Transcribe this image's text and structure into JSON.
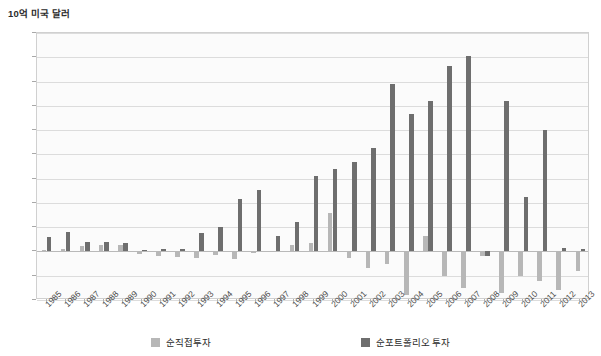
{
  "chart_data": {
    "type": "bar",
    "title": "10억 미국 달러",
    "xlabel": "",
    "ylabel": "10억 미국 달러",
    "ylim": [
      -200,
      900
    ],
    "ytick_step": 100,
    "yticks": [
      900,
      800,
      700,
      600,
      500,
      400,
      300,
      200,
      100,
      0,
      -100,
      -200
    ],
    "grid": true,
    "legend_position": "bottom",
    "categories": [
      "1985",
      "1986",
      "1987",
      "1988",
      "1989",
      "1990",
      "1991",
      "1992",
      "1993",
      "1994",
      "1995",
      "1996",
      "1997",
      "1998",
      "1999",
      "2000",
      "2001",
      "2002",
      "2003",
      "2004",
      "2005",
      "2006",
      "2007",
      "2008",
      "2009",
      "2010",
      "2011",
      "2012",
      "2013"
    ],
    "series": [
      {
        "name": "순직접투자",
        "color": "#b7b7b7",
        "values": [
          5,
          10,
          22,
          28,
          25,
          -12,
          -18,
          -22,
          -25,
          -15,
          -30,
          -5,
          -2,
          25,
          35,
          160,
          -25,
          -70,
          -50,
          -180,
          65,
          -100,
          -150,
          -20,
          -170,
          -100,
          -120,
          -160,
          -80
        ]
      },
      {
        "name": "순포트폴리오 투자",
        "color": "#6e6e6e",
        "values": [
          60,
          80,
          38,
          38,
          35,
          5,
          12,
          10,
          75,
          100,
          215,
          255,
          65,
          120,
          310,
          340,
          370,
          425,
          690,
          565,
          620,
          765,
          805,
          -20,
          620,
          225,
          500,
          15,
          10
        ]
      }
    ],
    "legend": [
      {
        "label": "순직접투자",
        "color": "#b7b7b7"
      },
      {
        "label": "순포트폴리오 투자",
        "color": "#6e6e6e"
      }
    ]
  }
}
